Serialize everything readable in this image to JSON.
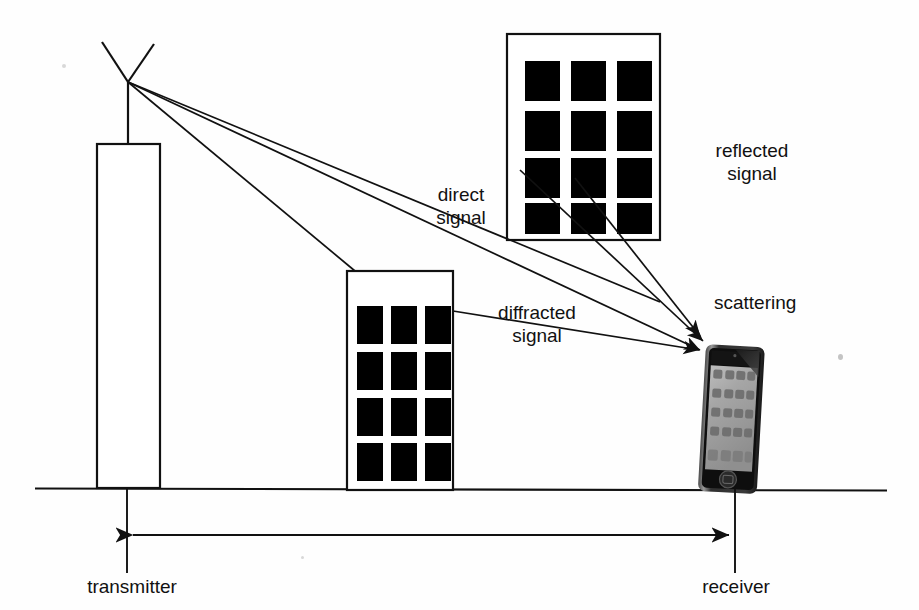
{
  "diagram": {
    "background_color": "#ffffff",
    "line_color": "#111111",
    "window_color": "#000000"
  },
  "labels": {
    "direct_signal": "direct\nsignal",
    "reflected_signal": "reflected\nsignal",
    "diffracted_signal": "diffracted\nsignal",
    "scattering": "scattering",
    "transmitter": "transmitter",
    "receiver": "receiver"
  },
  "elements": {
    "antenna": {
      "name": "transmitter-antenna",
      "vertex_x": 128,
      "vertex_y": 82
    },
    "tower": {
      "name": "transmitter-tower",
      "x": 97,
      "y": 144,
      "width": 63,
      "height": 344
    },
    "upper_building": {
      "name": "reflecting-building",
      "x": 507,
      "y": 34,
      "width": 153,
      "height": 206,
      "window_rows": 4,
      "window_cols": 3
    },
    "middle_building": {
      "name": "diffracting-building",
      "x": 347,
      "y": 271,
      "width": 106,
      "height": 219,
      "window_rows": 4,
      "window_cols": 3
    },
    "phone": {
      "name": "receiver-phone",
      "x": 706,
      "y": 344,
      "width": 60,
      "height": 148
    },
    "ground_line": {
      "name": "ground-line",
      "y": 488,
      "x1": 35,
      "x2": 887
    },
    "dimension": {
      "name": "distance-dimension",
      "y": 535,
      "x1": 127,
      "x2": 735
    }
  },
  "rays": {
    "to_reflector": {
      "name": "ray-transmitter-to-reflector",
      "from": [
        128,
        82
      ],
      "to": [
        660,
        302
      ]
    },
    "direct": {
      "name": "ray-direct-signal",
      "from": [
        128,
        82
      ],
      "to": [
        706,
        352
      ]
    },
    "to_diffractor": {
      "name": "ray-transmitter-to-diffractor",
      "from": [
        128,
        82
      ],
      "to": [
        355,
        271
      ]
    },
    "reflected": {
      "name": "ray-reflected-to-receiver",
      "from": [
        520,
        170
      ],
      "to": [
        708,
        346
      ]
    },
    "scattered": {
      "name": "ray-scattered-to-receiver",
      "from": [
        575,
        178
      ],
      "to": [
        704,
        340
      ]
    },
    "diffracted": {
      "name": "ray-diffracted-to-receiver",
      "from": [
        453,
        311
      ],
      "to": [
        704,
        352
      ]
    }
  }
}
